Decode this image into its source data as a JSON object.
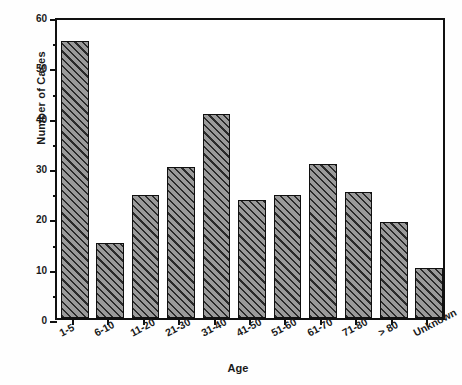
{
  "chart_data": {
    "type": "bar",
    "title": "",
    "subtitle": "",
    "xlabel": "Age",
    "ylabel": "Number of Cases",
    "categories": [
      "1-5",
      "6-10",
      "11-20",
      "21-30",
      "31-40",
      "41-50",
      "51-60",
      "61-70",
      "71-80",
      "> 80",
      "Unknown"
    ],
    "values": [
      55,
      15,
      24.5,
      30,
      40.5,
      23.5,
      24.5,
      30.5,
      25,
      19,
      10
    ],
    "ylim": [
      0,
      60
    ],
    "y_major_ticks": [
      0,
      10,
      20,
      30,
      40,
      50,
      60
    ],
    "y_minor_ticks": [
      5,
      15,
      25,
      35,
      45,
      55
    ],
    "y_tick_labels": [
      "0",
      "10",
      "20",
      "30",
      "40",
      "50",
      "60"
    ],
    "grid": false,
    "legend": false,
    "bar_fill": "hatched-diagonal",
    "bar_edge_color": "#101010",
    "bar_face_color": "#9a9a9a",
    "frame_color": "#111111",
    "background_color": "#ffffff"
  }
}
